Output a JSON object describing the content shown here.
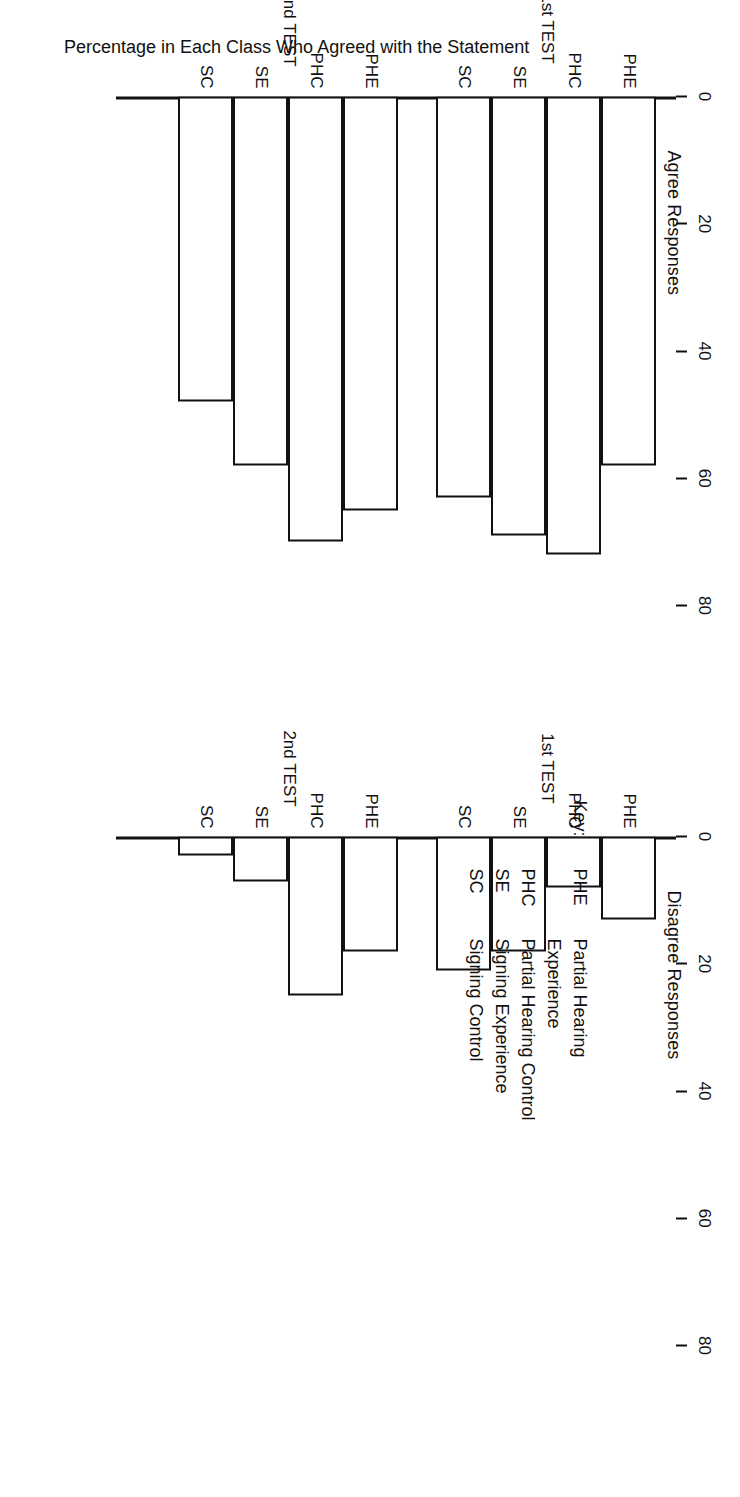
{
  "figure": {
    "orientation_note": "rotated",
    "axis_title": "Percentage in Each Class Who Agreed with the Statement"
  },
  "key": {
    "heading": "Key:",
    "entries": [
      {
        "abbr": "PHE",
        "desc_line1": "Partial Hearing",
        "desc_line2": "Experience"
      },
      {
        "abbr": "PHC",
        "desc_line1": "Partial Hearing Control",
        "desc_line2": ""
      },
      {
        "abbr": "SE",
        "desc_line1": "Signing Experience",
        "desc_line2": ""
      },
      {
        "abbr": "SC",
        "desc_line1": "Signing Control",
        "desc_line2": ""
      }
    ]
  },
  "panels": [
    {
      "id": "agree",
      "title": "Agree Responses"
    },
    {
      "id": "disagree",
      "title": "Disagree Responses"
    }
  ],
  "group_labels": [
    "1st TEST",
    "2nd TEST"
  ],
  "tick_labels": [
    "0",
    "20",
    "40",
    "60",
    "80"
  ],
  "category_labels": [
    "PHE",
    "PHC",
    "SE",
    "SC"
  ],
  "chart_data": [
    {
      "type": "bar",
      "title": "Agree Responses",
      "xlabel": "",
      "ylabel": "Percentage in Each Class Who Agreed with the Statement",
      "ylim": [
        0,
        88
      ],
      "yticks": [
        0,
        20,
        40,
        60,
        80
      ],
      "grid": false,
      "legend": "none",
      "groups": [
        "1st TEST",
        "2nd TEST"
      ],
      "categories": [
        "PHE",
        "PHC",
        "SE",
        "SC"
      ],
      "series": [
        {
          "name": "1st TEST",
          "values": [
            58,
            72,
            69,
            63
          ]
        },
        {
          "name": "2nd TEST",
          "values": [
            65,
            70,
            58,
            48
          ]
        }
      ]
    },
    {
      "type": "bar",
      "title": "Disagree Responses",
      "xlabel": "",
      "ylabel": "",
      "ylim": [
        0,
        88
      ],
      "yticks": [
        0,
        20,
        40,
        60,
        80
      ],
      "grid": false,
      "legend": "none",
      "groups": [
        "1st TEST",
        "2nd TEST"
      ],
      "categories": [
        "PHE",
        "PHC",
        "SE",
        "SC"
      ],
      "series": [
        {
          "name": "1st TEST",
          "values": [
            13,
            8,
            18,
            21
          ]
        },
        {
          "name": "2nd TEST",
          "values": [
            18,
            25,
            7,
            3
          ]
        }
      ]
    }
  ]
}
